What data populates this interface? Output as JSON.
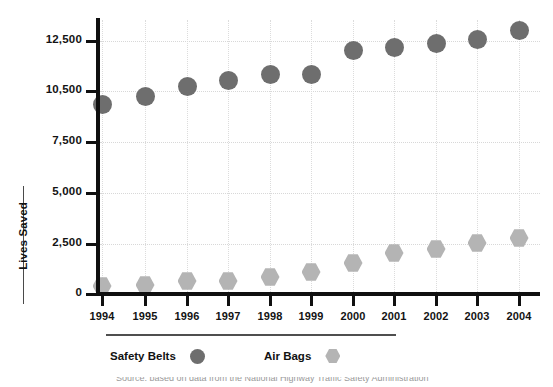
{
  "chart_data": {
    "type": "scatter",
    "title": "",
    "xlabel": "",
    "ylabel": "Lives Saved",
    "grid": true,
    "legend_position": "bottom-left",
    "categories": [
      "1994",
      "1995",
      "1996",
      "1997",
      "1998",
      "1999",
      "2000",
      "2001",
      "2002",
      "2003",
      "2004"
    ],
    "x": [
      1994,
      1995,
      1996,
      1997,
      1998,
      1999,
      2000,
      2001,
      2002,
      2003,
      2004
    ],
    "ytick_labels": [
      "0",
      "2,500",
      "5,000",
      "7,500",
      "10,500",
      "12,500"
    ],
    "ytick_values": [
      0,
      2500,
      5000,
      7500,
      10500,
      12500
    ],
    "ylim": [
      0,
      13500
    ],
    "series": [
      {
        "name": "Safety Belts",
        "marker": "circle",
        "color": "#6e6e6e",
        "values": [
          9800,
          10300,
          10800,
          11100,
          11400,
          11400,
          12300,
          12400,
          12550,
          12700,
          13100
        ]
      },
      {
        "name": "Air Bags",
        "marker": "hexagon",
        "color": "#b4b4b4",
        "values": [
          500,
          550,
          700,
          700,
          900,
          1100,
          1650,
          2100,
          2300,
          2550,
          2750
        ]
      }
    ]
  },
  "axes": {
    "y_title": "Lives Saved",
    "y_ticks": [
      {
        "label": "12,500",
        "value": 12500,
        "px": 41
      },
      {
        "label": "10,500",
        "value": 10500,
        "px": 91
      },
      {
        "label": "7,500",
        "value": 7500,
        "px": 142
      },
      {
        "label": "5,000",
        "value": 5000,
        "px": 193
      },
      {
        "label": "2,500",
        "value": 2500,
        "px": 244
      },
      {
        "label": "0",
        "value": 0,
        "px": 294
      }
    ],
    "x_ticks": [
      {
        "label": "1994",
        "px": 102
      },
      {
        "label": "1995",
        "px": 145
      },
      {
        "label": "1996",
        "px": 187
      },
      {
        "label": "1997",
        "px": 228
      },
      {
        "label": "1998",
        "px": 270
      },
      {
        "label": "1999",
        "px": 311
      },
      {
        "label": "2000",
        "px": 353
      },
      {
        "label": "2001",
        "px": 394
      },
      {
        "label": "2002",
        "px": 436
      },
      {
        "label": "2003",
        "px": 477
      },
      {
        "label": "2004",
        "px": 519
      }
    ]
  },
  "legend": {
    "entries": [
      {
        "label": "Safety Belts",
        "marker": "circle",
        "color": "#6e6e6e"
      },
      {
        "label": "Air Bags",
        "marker": "hexagon",
        "color": "#b4b4b4"
      }
    ]
  },
  "caption": {
    "text": "Source: based on data from the National Highway Traffic Safety Administration"
  },
  "marker_pixels": {
    "belts_y": [
      104,
      96,
      86,
      80,
      74,
      74,
      50,
      47,
      43,
      39,
      30
    ],
    "bags_y": [
      286,
      285,
      281,
      281,
      277,
      272,
      263,
      253,
      249,
      243,
      238
    ]
  }
}
